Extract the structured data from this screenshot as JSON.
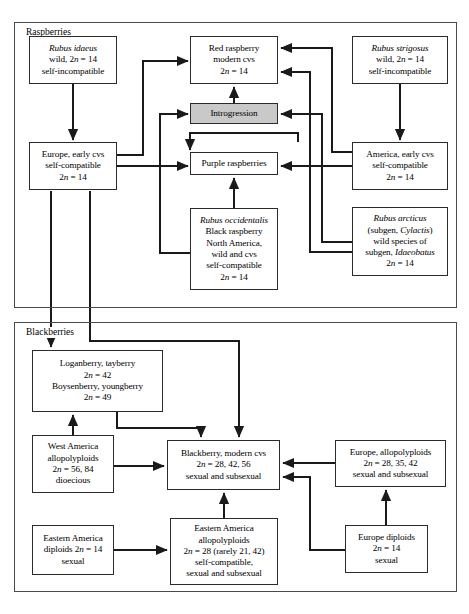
{
  "figure": {
    "type": "flow-diagram",
    "title_visible": false,
    "panels": [
      {
        "id": "raspberries",
        "label": "Raspberries",
        "x": 14,
        "y": 22,
        "w": 441,
        "h": 284
      },
      {
        "id": "blackberries",
        "label": "Blackberries",
        "x": 14,
        "y": 322,
        "w": 441,
        "h": 268
      }
    ]
  },
  "colors": {
    "box_border": "#2b2b2b",
    "panel_border": "#4a4a4a",
    "shaded_fill": "#c9c9c9",
    "arrow": "#1a1a1a",
    "background": "#ffffff"
  },
  "nodes": [
    {
      "id": "rubus-idaeus",
      "panel": "raspberries",
      "x": 29,
      "y": 36,
      "w": 88,
      "h": 48,
      "shaded": false,
      "lines": [
        {
          "text": "Rubus idaeus",
          "italic": true
        },
        {
          "text": "wild, 2n = 14",
          "italic": false,
          "n_italic": true
        },
        {
          "text": "self-incompatible",
          "italic": false
        }
      ]
    },
    {
      "id": "red-raspberry-modern-cvs",
      "panel": "raspberries",
      "x": 190,
      "y": 36,
      "w": 88,
      "h": 48,
      "shaded": false,
      "lines": [
        {
          "text": "Red raspberry",
          "italic": false
        },
        {
          "text": "modern cvs",
          "italic": false
        },
        {
          "text": "2n = 14",
          "italic": false,
          "n_italic": true
        }
      ]
    },
    {
      "id": "rubus-strigosus",
      "panel": "raspberries",
      "x": 352,
      "y": 36,
      "w": 96,
      "h": 48,
      "shaded": false,
      "lines": [
        {
          "text": "Rubus strigosus",
          "italic": true
        },
        {
          "text": "wild, 2n = 14",
          "italic": false,
          "n_italic": true
        },
        {
          "text": "self-incompatible",
          "italic": false
        }
      ]
    },
    {
      "id": "introgression",
      "panel": "raspberries",
      "x": 190,
      "y": 103,
      "w": 88,
      "h": 21,
      "shaded": true,
      "lines": [
        {
          "text": "Introgression",
          "italic": false
        }
      ]
    },
    {
      "id": "europe-early-cvs",
      "panel": "raspberries",
      "x": 29,
      "y": 142,
      "w": 88,
      "h": 48,
      "shaded": false,
      "lines": [
        {
          "text": "Europe, early cvs",
          "italic": false
        },
        {
          "text": "self-compatible",
          "italic": false
        },
        {
          "text": "2n = 14",
          "italic": false,
          "n_italic": true
        }
      ]
    },
    {
      "id": "purple-raspberries",
      "panel": "raspberries",
      "x": 190,
      "y": 152,
      "w": 88,
      "h": 23,
      "shaded": false,
      "lines": [
        {
          "text": "Purple raspberries",
          "italic": false
        }
      ]
    },
    {
      "id": "america-early-cvs",
      "panel": "raspberries",
      "x": 352,
      "y": 142,
      "w": 96,
      "h": 48,
      "shaded": false,
      "lines": [
        {
          "text": "America, early cvs",
          "italic": false
        },
        {
          "text": "self-compatible",
          "italic": false
        },
        {
          "text": "2n = 14",
          "italic": false,
          "n_italic": true
        }
      ]
    },
    {
      "id": "rubus-occidentalis",
      "panel": "raspberries",
      "x": 190,
      "y": 208,
      "w": 88,
      "h": 82,
      "shaded": false,
      "lines": [
        {
          "text": "Rubus occidentalis",
          "italic": true
        },
        {
          "text": "Black raspberry",
          "italic": false
        },
        {
          "text": "North America,",
          "italic": false
        },
        {
          "text": "wild and cvs",
          "italic": false
        },
        {
          "text": "self-compatible",
          "italic": false
        },
        {
          "text": "2n = 14",
          "italic": false,
          "n_italic": true
        }
      ]
    },
    {
      "id": "rubus-arcticus",
      "panel": "raspberries",
      "x": 352,
      "y": 207,
      "w": 96,
      "h": 69,
      "shaded": false,
      "lines": [
        {
          "text": "Rubus arcticus",
          "italic": true
        },
        {
          "text": "(subgen, Cylactis)",
          "italic": false,
          "tail_italic": "Cylactis"
        },
        {
          "text": "wild species of",
          "italic": false
        },
        {
          "text": "subgen, Idaeobatus",
          "italic": false,
          "tail_italic": "Idaeobatus"
        },
        {
          "text": "2n = 14",
          "italic": false,
          "n_italic": true
        }
      ]
    },
    {
      "id": "loganberry-tayberry",
      "panel": "blackberries",
      "x": 32,
      "y": 350,
      "w": 131,
      "h": 62,
      "shaded": false,
      "lines": [
        {
          "text": "Loganberry, tayberry",
          "italic": false
        },
        {
          "text": "2n = 42",
          "italic": false,
          "n_italic": true
        },
        {
          "text": "Boysenberry, youngberry",
          "italic": false
        },
        {
          "text": "2n = 49",
          "italic": false,
          "n_italic": true
        }
      ]
    },
    {
      "id": "west-america-allopolyploids",
      "panel": "blackberries",
      "x": 32,
      "y": 435,
      "w": 82,
      "h": 58,
      "shaded": false,
      "lines": [
        {
          "text": "West America",
          "italic": false
        },
        {
          "text": "allopolyploids",
          "italic": false
        },
        {
          "text": "2n = 56, 84",
          "italic": false,
          "n_italic": true
        },
        {
          "text": "dioecious",
          "italic": false
        }
      ]
    },
    {
      "id": "blackberry-modern-cvs",
      "panel": "blackberries",
      "x": 167,
      "y": 440,
      "w": 113,
      "h": 50,
      "shaded": false,
      "lines": [
        {
          "text": "Blackberry, modern cvs",
          "italic": false
        },
        {
          "text": "2n = 28, 42, 56",
          "italic": false,
          "n_italic": true
        },
        {
          "text": "sexual and subsexual",
          "italic": false
        }
      ]
    },
    {
      "id": "europe-allopolyploids",
      "panel": "blackberries",
      "x": 335,
      "y": 440,
      "w": 111,
      "h": 47,
      "shaded": false,
      "lines": [
        {
          "text": "Europe, allopolyploids",
          "italic": false
        },
        {
          "text": "2n = 28, 35, 42",
          "italic": false,
          "n_italic": true
        },
        {
          "text": "sexual and subsexual",
          "italic": false
        }
      ]
    },
    {
      "id": "eastern-america-diploids",
      "panel": "blackberries",
      "x": 32,
      "y": 525,
      "w": 82,
      "h": 50,
      "shaded": false,
      "lines": [
        {
          "text": "Eastern America",
          "italic": false
        },
        {
          "text": "diploids 2n = 14",
          "italic": false,
          "n_italic": true
        },
        {
          "text": "sexual",
          "italic": false
        }
      ]
    },
    {
      "id": "eastern-america-allopolyploids",
      "panel": "blackberries",
      "x": 170,
      "y": 518,
      "w": 108,
      "h": 67,
      "shaded": false,
      "lines": [
        {
          "text": "Eastern America",
          "italic": false
        },
        {
          "text": "allopolyploids",
          "italic": false
        },
        {
          "text": "2n = 28 (rarely 21, 42)",
          "italic": false,
          "n_italic": true
        },
        {
          "text": "self-compatible,",
          "italic": false
        },
        {
          "text": "sexual and subsexual",
          "italic": false
        }
      ]
    },
    {
      "id": "europe-diploids",
      "panel": "blackberries",
      "x": 345,
      "y": 525,
      "w": 83,
      "h": 48,
      "shaded": false,
      "lines": [
        {
          "text": "Europe diploids",
          "italic": false
        },
        {
          "text": "2n = 14",
          "italic": false,
          "n_italic": true
        },
        {
          "text": "sexual",
          "italic": false
        }
      ]
    }
  ],
  "edges": [
    {
      "id": "idaeus-to-europe",
      "from": "rubus-idaeus",
      "to": "europe-early-cvs",
      "path": "M 73,84 L 73,140"
    },
    {
      "id": "strigosus-to-america",
      "from": "rubus-strigosus",
      "to": "america-early-cvs",
      "path": "M 400,84 L 400,140"
    },
    {
      "id": "europe-to-red",
      "from": "europe-early-cvs",
      "to": "red-raspberry-modern-cvs",
      "path": "M 117,155 L 143,155 L 143,61 L 188,61"
    },
    {
      "id": "europe-to-purple",
      "from": "europe-early-cvs",
      "to": "purple-raspberries",
      "path": "M 117,166 L 188,166"
    },
    {
      "id": "occidentalis-to-introgr",
      "from": "rubus-occidentalis",
      "to": "introgression",
      "path": "M 190,253 L 160,253 L 160,114 L 188,114"
    },
    {
      "id": "occidentalis-to-purple",
      "from": "rubus-occidentalis",
      "to": "purple-raspberries",
      "path": "M 234,208 L 234,178"
    },
    {
      "id": "introgr-to-red",
      "from": "introgression",
      "to": "red-raspberry-modern-cvs",
      "path": "M 234,103 L 234,87"
    },
    {
      "id": "america-to-red",
      "from": "america-early-cvs",
      "to": "red-raspberry-modern-cvs",
      "path": "M 352,152 L 332,152 L 332,48 L 281,48"
    },
    {
      "id": "america-to-purple",
      "from": "america-early-cvs",
      "to": "purple-raspberries",
      "path": "M 352,166 L 281,166"
    },
    {
      "id": "arcticus-to-red",
      "from": "rubus-arcticus",
      "to": "red-raspberry-modern-cvs",
      "path": "M 352,252 L 310,252 L 310,72 L 281,72"
    },
    {
      "id": "arcticus-to-introgr",
      "from": "rubus-arcticus",
      "to": "introgression",
      "path": "M 352,242 L 322,242 L 322,114 L 281,114"
    },
    {
      "id": "purple-up-right",
      "from": "purple-raspberries",
      "to": "america-early-cvs",
      "path": "M 298,142 L 298,133 L 190,133 L 190,150"
    },
    {
      "id": "europe-down-logan",
      "from": "europe-early-cvs",
      "to": "loganberry-tayberry",
      "path": "M 51,191 L 51,347"
    },
    {
      "id": "europe-down-blackberry",
      "from": "europe-early-cvs",
      "to": "blackberry-modern-cvs",
      "path": "M 90,191 L 90,341 L 239,341 L 239,437"
    },
    {
      "id": "west-to-logan",
      "from": "west-america-allopolyploids",
      "to": "loganberry-tayberry",
      "path": "M 73,435 L 73,415"
    },
    {
      "id": "logan-to-blackberry",
      "from": "loganberry-tayberry",
      "to": "blackberry-modern-cvs",
      "path": "M 117,412 L 117,428 L 201,428 L 201,437"
    },
    {
      "id": "west-to-blackberry",
      "from": "west-america-allopolyploids",
      "to": "blackberry-modern-cvs",
      "path": "M 114,466 L 164,466"
    },
    {
      "id": "eastamdip-to-eastamallo",
      "from": "eastern-america-diploids",
      "to": "eastern-america-allopolyploids",
      "path": "M 114,550 L 167,550"
    },
    {
      "id": "eastamallo-to-blackberry",
      "from": "eastern-america-allopolyploids",
      "to": "blackberry-modern-cvs",
      "path": "M 224,518 L 224,493"
    },
    {
      "id": "europeallo-to-blackberry",
      "from": "europe-allopolyploids",
      "to": "blackberry-modern-cvs",
      "path": "M 335,463 L 283,463"
    },
    {
      "id": "europedip-to-europeallo",
      "from": "europe-diploids",
      "to": "europe-allopolyploids",
      "path": "M 386,525 L 386,490"
    },
    {
      "id": "europedip-to-blackberry",
      "from": "europe-diploids",
      "to": "blackberry-modern-cvs",
      "path": "M 345,550 L 310,550 L 310,477 L 283,477"
    }
  ]
}
